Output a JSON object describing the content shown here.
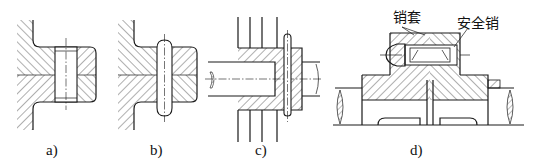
{
  "figure": {
    "line_color": "#1a1a1a",
    "background": "#ffffff"
  },
  "panels": [
    {
      "id": "a",
      "caption": "a)",
      "description": "cylindrical pin locating two hatched plates"
    },
    {
      "id": "b",
      "caption": "b)",
      "description": "pin with rounded ends through two hatched plates"
    },
    {
      "id": "c",
      "caption": "c)",
      "description": "transverse pin through hub and shaft"
    },
    {
      "id": "d",
      "caption": "d)",
      "description": "safety pin coupling with pin sleeves"
    }
  ],
  "labels": {
    "pin_sleeve": "销套",
    "safety_pin": "安全销"
  }
}
